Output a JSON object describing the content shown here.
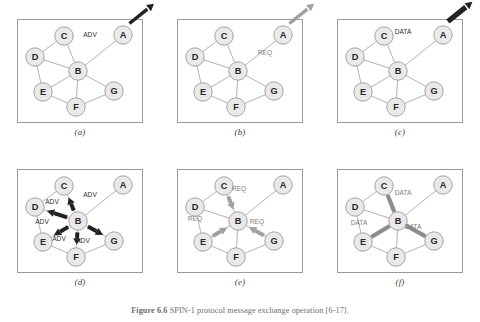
{
  "figure": {
    "caption_bold": "Figure 6.6",
    "caption_text": "SPIN-1 protocol message exchange operation [6-17].",
    "width": 480,
    "height": 322
  },
  "colors": {
    "node_fill": "#e9e9e9",
    "node_stroke": "#9a9a9a",
    "node_text": "#2a2a2a",
    "edge": "#9e9e9e",
    "panel_border": "#9a9a9a",
    "arrow_dark": "#222222",
    "arrow_gray": "#a0a0a0",
    "data_bar": "#8c8c8c",
    "label_text": "#3a3a3a",
    "background": "#ffffff"
  },
  "nodes": {
    "A": {
      "label": "A",
      "x": 106,
      "y": 16
    },
    "B": {
      "label": "B",
      "x": 61,
      "y": 52
    },
    "C": {
      "label": "C",
      "x": 47,
      "y": 17
    },
    "D": {
      "label": "D",
      "x": 18,
      "y": 38
    },
    "E": {
      "label": "E",
      "x": 26,
      "y": 73
    },
    "F": {
      "label": "F",
      "x": 59,
      "y": 88
    },
    "G": {
      "label": "G",
      "x": 97,
      "y": 72
    }
  },
  "edges": [
    {
      "from": "C",
      "to": "D"
    },
    {
      "from": "C",
      "to": "B"
    },
    {
      "from": "D",
      "to": "B"
    },
    {
      "from": "D",
      "to": "E"
    },
    {
      "from": "E",
      "to": "B"
    },
    {
      "from": "B",
      "to": "F"
    },
    {
      "from": "E",
      "to": "F"
    },
    {
      "from": "B",
      "to": "G"
    },
    {
      "from": "F",
      "to": "G"
    },
    {
      "from": "B",
      "to": "A"
    }
  ],
  "messages": {
    "adv": "ADV",
    "req": "REQ",
    "data": "DATA"
  },
  "panels": [
    {
      "id": "a",
      "label": "(a)",
      "description": "Node A advertises new data to B",
      "arrows": [
        {
          "kind": "thick",
          "color": "dark",
          "message": "ADV",
          "from": "A",
          "to": "B",
          "label_x": 73,
          "label_y": 18
        }
      ]
    },
    {
      "id": "b",
      "label": "(b)",
      "description": "Node B sends request back to A",
      "arrows": [
        {
          "kind": "thick",
          "color": "gray",
          "message": "REQ",
          "from": "B",
          "to": "A",
          "label_x": 88,
          "label_y": 36
        }
      ]
    },
    {
      "id": "c",
      "label": "(c)",
      "description": "Node A sends data to B",
      "arrows": [
        {
          "kind": "bar",
          "color": "dark",
          "message": "DATA",
          "from": "A",
          "to": "B",
          "label_x": 66,
          "label_y": 15
        }
      ]
    },
    {
      "id": "d",
      "label": "(d)",
      "description": "Node B advertises to all neighbours",
      "arrows": [
        {
          "kind": "thick",
          "color": "dark",
          "message": "ADV",
          "from": "B",
          "to": "C",
          "label_x": 73,
          "label_y": 28
        },
        {
          "kind": "thick",
          "color": "dark",
          "message": "ADV",
          "from": "B",
          "to": "D",
          "label_x": 35,
          "label_y": 35
        },
        {
          "kind": "thick",
          "color": "dark",
          "message": "ADV",
          "from": "B",
          "to": "E",
          "label_x": 25,
          "label_y": 55
        },
        {
          "kind": "thick",
          "color": "dark",
          "message": "ADV",
          "from": "B",
          "to": "F",
          "label_x": 66,
          "label_y": 74
        },
        {
          "kind": "thick",
          "color": "dark",
          "message": "ADV",
          "from": "B",
          "to": "G",
          "label_x": 42,
          "label_y": 72
        }
      ]
    },
    {
      "id": "e",
      "label": "(e)",
      "description": "Neighbours request data from B",
      "arrows": [
        {
          "kind": "thick",
          "color": "gray",
          "message": "REQ",
          "from": "C",
          "to": "B",
          "label_x": 62,
          "label_y": 22
        },
        {
          "kind": "thick",
          "color": "gray",
          "message": "REQ",
          "from": "E",
          "to": "B",
          "label_x": 18,
          "label_y": 52
        },
        {
          "kind": "thick",
          "color": "gray",
          "message": "REQ",
          "from": "G",
          "to": "B",
          "label_x": 80,
          "label_y": 55
        }
      ]
    },
    {
      "id": "f",
      "label": "(f)",
      "description": "Node B sends data to requesting nodes",
      "arrows": [
        {
          "kind": "bar",
          "color": "gray",
          "message": "DATA",
          "from": "B",
          "to": "C",
          "label_x": 66,
          "label_y": 26
        },
        {
          "kind": "bar",
          "color": "gray",
          "message": "DATA",
          "from": "B",
          "to": "E",
          "label_x": 22,
          "label_y": 56
        },
        {
          "kind": "bar",
          "color": "gray",
          "message": "DATA",
          "from": "B",
          "to": "G",
          "label_x": 76,
          "label_y": 60
        }
      ]
    }
  ]
}
